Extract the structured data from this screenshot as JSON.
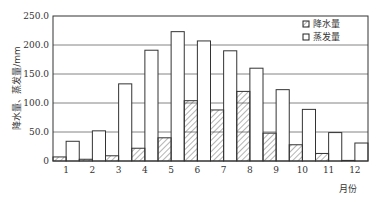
{
  "chart_data": {
    "type": "bar",
    "title": "",
    "xlabel": "月份",
    "ylabel": "降水量、蒸发量/mm",
    "ylim": [
      0,
      250
    ],
    "yticks": [
      "0",
      "50.0",
      "100.0",
      "150.0",
      "200.0",
      "250.0"
    ],
    "ytick_values": [
      0,
      50,
      100,
      150,
      200,
      250
    ],
    "grid": true,
    "legend_position": "top-right",
    "categories": [
      "1",
      "2",
      "3",
      "4",
      "5",
      "6",
      "7",
      "8",
      "9",
      "10",
      "11",
      "12"
    ],
    "series": [
      {
        "name": "降水量",
        "pattern": "hatched",
        "values": [
          7,
          3,
          9,
          22,
          40,
          104,
          88,
          120,
          48,
          28,
          13,
          1
        ]
      },
      {
        "name": "蒸发量",
        "pattern": "empty",
        "values": [
          34,
          52,
          133,
          191,
          223,
          207,
          190,
          160,
          123,
          89,
          49,
          31
        ]
      }
    ]
  },
  "colors": {
    "stroke": "#333333",
    "grid": "#555555",
    "fill": "#ffffff"
  }
}
